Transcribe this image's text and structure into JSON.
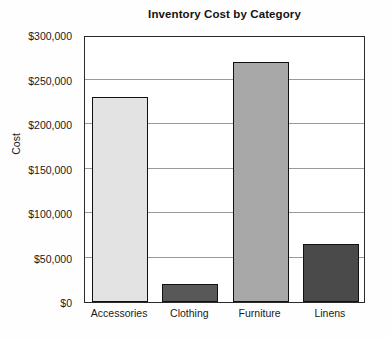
{
  "chart_data": {
    "type": "bar",
    "title": "Inventory Cost by Category",
    "xlabel": "",
    "ylabel": "Cost",
    "categories": [
      "Accessories",
      "Clothing",
      "Furniture",
      "Linens"
    ],
    "values": [
      230000,
      20000,
      270000,
      65000
    ],
    "value_labels": [
      "$230,000",
      "$20,000",
      "$270,000",
      "$65,000"
    ],
    "bar_colors": [
      "#e3e3e3",
      "#585858",
      "#a8a8a8",
      "#4a4a4a"
    ],
    "bar_edge_color": "#111111",
    "ylim": [
      0,
      300000
    ],
    "ytick_values": [
      0,
      50000,
      100000,
      150000,
      200000,
      250000,
      300000
    ],
    "ytick_labels": [
      "$0",
      "$50,000",
      "$100,000",
      "$150,000",
      "$200,000",
      "$250,000",
      "$300,000"
    ],
    "grid": true,
    "grid_axis": "y",
    "grid_color": "#9a9a9a",
    "legend": false,
    "legend_position": "none",
    "plot_background": "#ffffff",
    "figure_background": "#fefefe",
    "axis_border_color": "#2b2b2b"
  }
}
